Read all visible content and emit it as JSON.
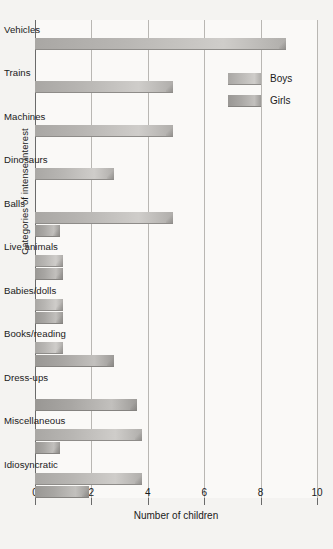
{
  "chart_data": {
    "type": "bar",
    "orientation": "horizontal",
    "title": "",
    "xlabel": "Number of children",
    "ylabel": "Categories of intense interest",
    "xlim": [
      0,
      10
    ],
    "xticks": [
      "0",
      "2",
      "4",
      "6",
      "8",
      "10"
    ],
    "xtick_values": [
      0,
      2,
      4,
      6,
      8,
      10
    ],
    "grid": true,
    "legend_position": "upper right",
    "categories": [
      "Vehicles",
      "Trains",
      "Machines",
      "Dinosaurs",
      "Balls",
      "Live animals",
      "Babies/dolls",
      "Books/reading",
      "Dress-ups",
      "Miscellaneous",
      "Idiosyncratic"
    ],
    "series": [
      {
        "name": "Boys",
        "color": "#b8b6b3",
        "values": [
          8.9,
          4.9,
          4.9,
          2.8,
          4.9,
          1.0,
          1.0,
          1.0,
          0,
          3.8,
          3.8
        ]
      },
      {
        "name": "Girls",
        "color": "#a8a6a3",
        "values": [
          0,
          0,
          0,
          0,
          0.9,
          1.0,
          1.0,
          2.8,
          3.6,
          0.9,
          1.9
        ]
      }
    ]
  },
  "legend": {
    "items": [
      {
        "label": "Boys",
        "key": "boys"
      },
      {
        "label": "Girls",
        "key": "girls"
      }
    ]
  }
}
